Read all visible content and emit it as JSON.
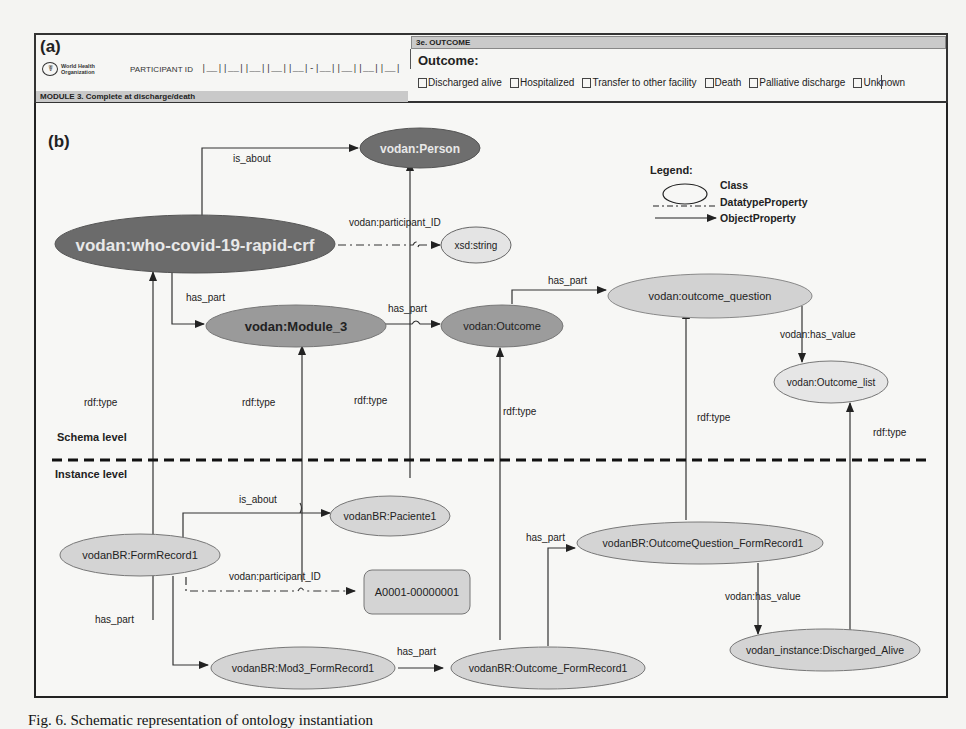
{
  "panel_a": {
    "label": "(a)",
    "who_logo": {
      "emblem": "☤",
      "line1": "World Health",
      "line2": "Organization"
    },
    "participant_id_label": "PARTICIPANT ID",
    "participant_id_boxes": "|__||__||__||__||__|-|__||__||__||__|",
    "module_bar": "MODULE 3. Complete at discharge/death",
    "outcome_section_header": "3e. OUTCOME",
    "outcome_title": "Outcome:",
    "outcome_options": [
      "Discharged alive",
      "Hospitalized",
      "Transfer to other facility",
      "Death",
      "Palliative discharge",
      "Unknown"
    ]
  },
  "panel_b": {
    "label": "(b)",
    "legend": {
      "title": "Legend:",
      "class": "Class",
      "datatype_property": "DatatypeProperty",
      "object_property": "ObjectProperty"
    },
    "levels": {
      "schema": "Schema level",
      "instance": "Instance level"
    },
    "colors": {
      "dark_class": "#6e6e6e",
      "mid_class": "#9a9a9a",
      "light_class": "#d2d2d2",
      "text_light": "#e8e8e8"
    },
    "nodes": {
      "person": "vodan:Person",
      "crf": "vodan:who-covid-19-rapid-crf",
      "xsd_string": "xsd:string",
      "module3": "vodan:Module_3",
      "outcome": "vodan:Outcome",
      "outcome_question": "vodan:outcome_question",
      "outcome_list": "vodan:Outcome_list",
      "paciente1": "vodanBR:Paciente1",
      "formrecord1": "vodanBR:FormRecord1",
      "literal_id": "A0001-00000001",
      "oq_formrecord1": "vodanBR:OutcomeQuestion_FormRecord1",
      "discharged_alive": "vodan_instance:Discharged_Alive",
      "mod3_formrecord1": "vodanBR:Mod3_FormRecord1",
      "outcome_formrecord1": "vodanBR:Outcome_FormRecord1"
    },
    "edges": {
      "is_about": "is_about",
      "participant_id": "vodan:participant_ID",
      "has_part": "has_part",
      "has_value": "vodan:has_value",
      "rdf_type": "rdf:type"
    }
  },
  "caption": "Fig. 6. Schematic representation of ontology instantiation"
}
